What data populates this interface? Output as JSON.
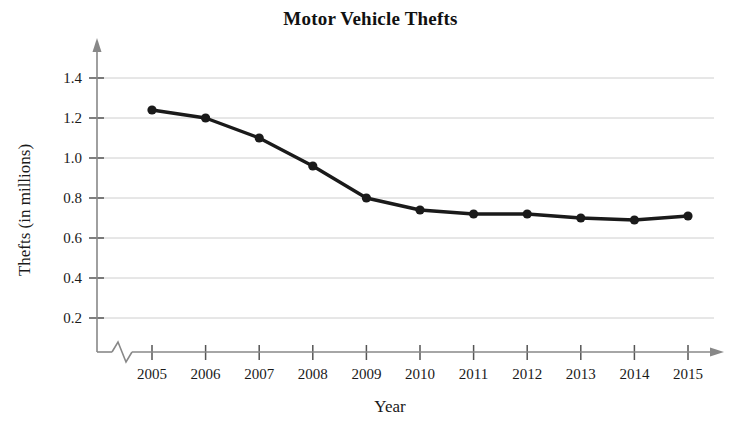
{
  "chart": {
    "title": "Motor Vehicle Thefts",
    "xlabel": "Year",
    "ylabel": "Thefts (in millions)"
  },
  "chart_data": {
    "type": "line",
    "title": "Motor Vehicle Thefts",
    "xlabel": "Year",
    "ylabel": "Thefts (in millions)",
    "categories": [
      "2005",
      "2006",
      "2007",
      "2008",
      "2009",
      "2010",
      "2011",
      "2012",
      "2013",
      "2014",
      "2015"
    ],
    "values": [
      1.24,
      1.2,
      1.1,
      0.96,
      0.8,
      0.74,
      0.72,
      0.72,
      0.7,
      0.69,
      0.71
    ],
    "x_tick_labels": [
      "2005",
      "2006",
      "2007",
      "2008",
      "2009",
      "2010",
      "2011",
      "2012",
      "2013",
      "2014",
      "2015"
    ],
    "y_tick_labels": [
      "0.2",
      "0.4",
      "0.6",
      "0.8",
      "1.0",
      "1.2",
      "1.4"
    ],
    "y_tick_values": [
      0.2,
      0.4,
      0.6,
      0.8,
      1.0,
      1.2,
      1.4
    ],
    "ylim": [
      0,
      1.5
    ],
    "grid": true,
    "grid_axis": "y",
    "legend": false,
    "axis_break": "zigzag on x-axis between origin and first category",
    "axis_arrows": true,
    "series_color": "#1a1a1a",
    "grid_color": "#c8c8c8",
    "marker": "filled-circle"
  }
}
